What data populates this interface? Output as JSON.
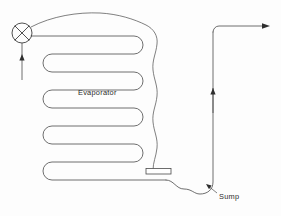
{
  "diagram": {
    "background_color": "#fdfdfd",
    "line_color": "#4a4a4a",
    "labels": {
      "evaporator": "Evaporator",
      "sump": "Sump"
    },
    "components": [
      {
        "name": "expansion-valve",
        "type": "valve",
        "symbol": "circle-with-x",
        "position": {
          "cx": 22,
          "cy": 33,
          "r": 10
        }
      },
      {
        "name": "evaporator-coil",
        "type": "serpentine-coil",
        "passes": 6,
        "label": "Evaporator"
      },
      {
        "name": "heater-element",
        "type": "rectangle",
        "position": {
          "x": 146,
          "y": 168,
          "width": 25,
          "height": 6
        }
      },
      {
        "name": "suction-riser",
        "type": "vertical-pipe"
      },
      {
        "name": "sump",
        "type": "u-bend",
        "label": "Sump"
      }
    ],
    "flow_arrows": [
      {
        "name": "inlet-flow-arrow",
        "direction": "up",
        "x": 22,
        "y_tail": 80,
        "y_head": 54
      },
      {
        "name": "riser-flow-arrow",
        "direction": "up",
        "x": 213,
        "y_tail": 113,
        "y_head": 88
      },
      {
        "name": "outlet-flow-arrow",
        "direction": "right",
        "y": 31,
        "x_tail": 240,
        "x_head": 268
      }
    ]
  }
}
